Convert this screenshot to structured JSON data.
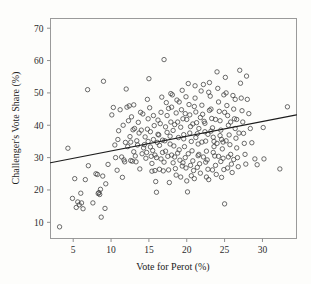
{
  "chart_data": {
    "type": "scatter",
    "title": "",
    "xlabel": "Vote for Perot (%)",
    "ylabel": "Challenger's Vote Share (%)",
    "xlim": [
      2.0,
      34.5
    ],
    "ylim": [
      5.0,
      73.0
    ],
    "xticks": [
      5,
      10,
      15,
      20,
      25,
      30
    ],
    "yticks": [
      10,
      20,
      30,
      40,
      50,
      60,
      70
    ],
    "xtick_labels": [
      "5",
      "10",
      "15",
      "20",
      "25",
      "30"
    ],
    "ytick_labels": [
      "10",
      "20",
      "30",
      "40",
      "50",
      "60",
      "70"
    ],
    "grid": false,
    "legend": null,
    "marker": {
      "style": "open-circle",
      "radius_px": 2.2,
      "edge_color": "#3c3c3c",
      "fill_color": "none"
    },
    "frame_color": "#9a9a9a",
    "background_color": "#fdfdfb",
    "trendline": {
      "type": "linear-fit",
      "color": "#1c1c1c",
      "x_start": 2.0,
      "y_start": 28.4,
      "x_end": 34.5,
      "y_end": 43.2,
      "slope": 0.455,
      "intercept": 27.49
    },
    "n_points": 281,
    "points": [
      [
        3.2,
        8.6
      ],
      [
        4.3,
        32.9
      ],
      [
        4.9,
        17.4
      ],
      [
        5.2,
        23.5
      ],
      [
        5.4,
        14.6
      ],
      [
        5.6,
        16.3
      ],
      [
        5.8,
        15.4
      ],
      [
        6.0,
        19.0
      ],
      [
        6.1,
        16.0
      ],
      [
        6.3,
        14.2
      ],
      [
        6.6,
        23.2
      ],
      [
        6.9,
        51.0
      ],
      [
        7.0,
        27.5
      ],
      [
        7.6,
        16.0
      ],
      [
        8.0,
        25.0
      ],
      [
        8.2,
        24.8
      ],
      [
        8.3,
        18.9
      ],
      [
        8.4,
        19.2
      ],
      [
        8.5,
        18.6
      ],
      [
        8.6,
        20.2
      ],
      [
        8.7,
        11.6
      ],
      [
        8.9,
        24.3
      ],
      [
        9.0,
        53.6
      ],
      [
        9.2,
        14.3
      ],
      [
        9.3,
        21.9
      ],
      [
        9.6,
        27.9
      ],
      [
        10.1,
        43.2
      ],
      [
        10.3,
        45.5
      ],
      [
        10.5,
        33.9
      ],
      [
        10.6,
        30.0
      ],
      [
        10.8,
        26.1
      ],
      [
        11.0,
        38.3
      ],
      [
        11.2,
        44.8
      ],
      [
        11.4,
        30.2
      ],
      [
        11.5,
        23.9
      ],
      [
        11.7,
        29.3
      ],
      [
        11.8,
        28.7
      ],
      [
        11.9,
        34.7
      ],
      [
        12.0,
        51.2
      ],
      [
        12.1,
        45.6
      ],
      [
        12.3,
        41.4
      ],
      [
        12.4,
        46.0
      ],
      [
        12.5,
        36.5
      ],
      [
        12.6,
        29.1
      ],
      [
        12.8,
        28.9
      ],
      [
        12.9,
        38.6
      ],
      [
        13.0,
        46.3
      ],
      [
        13.1,
        39.0
      ],
      [
        13.2,
        30.5
      ],
      [
        13.3,
        28.7
      ],
      [
        13.5,
        33.9
      ],
      [
        13.6,
        40.9
      ],
      [
        13.8,
        26.5
      ],
      [
        13.9,
        44.0
      ],
      [
        14.0,
        38.5
      ],
      [
        14.1,
        31.2
      ],
      [
        14.2,
        43.5
      ],
      [
        14.3,
        33.0
      ],
      [
        14.5,
        36.4
      ],
      [
        14.6,
        29.8
      ],
      [
        14.7,
        31.6
      ],
      [
        14.8,
        48.0
      ],
      [
        14.9,
        42.0
      ],
      [
        15.0,
        54.4
      ],
      [
        15.1,
        45.4
      ],
      [
        15.2,
        33.3
      ],
      [
        15.3,
        30.4
      ],
      [
        15.4,
        25.8
      ],
      [
        15.5,
        32.2
      ],
      [
        15.6,
        35.6
      ],
      [
        15.7,
        39.9
      ],
      [
        15.8,
        26.0
      ],
      [
        15.9,
        22.6
      ],
      [
        16.0,
        19.3
      ],
      [
        16.1,
        34.7
      ],
      [
        16.2,
        37.2
      ],
      [
        16.3,
        37.0
      ],
      [
        16.4,
        26.4
      ],
      [
        16.5,
        40.5
      ],
      [
        16.6,
        44.0
      ],
      [
        16.7,
        48.7
      ],
      [
        16.8,
        31.6
      ],
      [
        16.9,
        25.9
      ],
      [
        17.0,
        60.3
      ],
      [
        17.1,
        35.2
      ],
      [
        17.2,
        39.5
      ],
      [
        17.3,
        47.0
      ],
      [
        17.4,
        43.0
      ],
      [
        17.5,
        30.4
      ],
      [
        17.6,
        26.2
      ],
      [
        17.7,
        22.3
      ],
      [
        17.8,
        36.6
      ],
      [
        17.9,
        41.0
      ],
      [
        18.0,
        45.6
      ],
      [
        18.1,
        49.4
      ],
      [
        18.2,
        38.4
      ],
      [
        18.3,
        33.6
      ],
      [
        18.4,
        30.2
      ],
      [
        18.5,
        26.6
      ],
      [
        18.6,
        43.8
      ],
      [
        18.7,
        47.8
      ],
      [
        18.8,
        41.0
      ],
      [
        18.9,
        36.2
      ],
      [
        19.0,
        32.4
      ],
      [
        19.1,
        29.2
      ],
      [
        19.2,
        24.0
      ],
      [
        19.3,
        44.8
      ],
      [
        19.4,
        50.8
      ],
      [
        19.5,
        42.0
      ],
      [
        19.6,
        37.1
      ],
      [
        19.7,
        33.4
      ],
      [
        19.8,
        30.0
      ],
      [
        19.9,
        26.8
      ],
      [
        20.0,
        22.8
      ],
      [
        20.1,
        19.4
      ],
      [
        20.2,
        52.9
      ],
      [
        20.3,
        46.4
      ],
      [
        20.4,
        43.2
      ],
      [
        20.5,
        39.6
      ],
      [
        20.6,
        35.0
      ],
      [
        20.7,
        32.1
      ],
      [
        20.8,
        29.0
      ],
      [
        20.9,
        26.0
      ],
      [
        21.0,
        23.5
      ],
      [
        21.1,
        48.4
      ],
      [
        21.2,
        44.1
      ],
      [
        21.3,
        40.8
      ],
      [
        21.4,
        37.4
      ],
      [
        21.5,
        34.2
      ],
      [
        21.6,
        31.0
      ],
      [
        21.7,
        28.1
      ],
      [
        21.8,
        25.2
      ],
      [
        21.9,
        50.6
      ],
      [
        22.0,
        46.2
      ],
      [
        22.1,
        43.4
      ],
      [
        22.2,
        52.6
      ],
      [
        22.3,
        41.2
      ],
      [
        22.4,
        38.0
      ],
      [
        22.5,
        35.1
      ],
      [
        22.6,
        32.0
      ],
      [
        22.7,
        29.3
      ],
      [
        22.8,
        26.4
      ],
      [
        22.9,
        23.2
      ],
      [
        23.0,
        53.2
      ],
      [
        23.1,
        49.0
      ],
      [
        23.2,
        45.0
      ],
      [
        23.3,
        42.1
      ],
      [
        23.4,
        39.2
      ],
      [
        23.5,
        36.3
      ],
      [
        23.6,
        33.4
      ],
      [
        23.7,
        30.5
      ],
      [
        23.8,
        27.6
      ],
      [
        23.9,
        24.8
      ],
      [
        24.0,
        56.5
      ],
      [
        24.1,
        51.4
      ],
      [
        24.2,
        47.2
      ],
      [
        24.3,
        44.3
      ],
      [
        24.4,
        41.4
      ],
      [
        24.5,
        38.5
      ],
      [
        24.6,
        35.6
      ],
      [
        24.7,
        32.7
      ],
      [
        24.8,
        29.8
      ],
      [
        24.9,
        26.3
      ],
      [
        25.0,
        15.7
      ],
      [
        25.1,
        54.8
      ],
      [
        25.2,
        50.0
      ],
      [
        25.3,
        46.1
      ],
      [
        25.4,
        43.0
      ],
      [
        25.5,
        40.0
      ],
      [
        25.6,
        37.0
      ],
      [
        25.7,
        34.0
      ],
      [
        25.8,
        31.0
      ],
      [
        25.9,
        28.0
      ],
      [
        26.0,
        25.4
      ],
      [
        26.1,
        49.2
      ],
      [
        26.2,
        45.0
      ],
      [
        26.3,
        42.0
      ],
      [
        26.4,
        39.0
      ],
      [
        26.5,
        36.0
      ],
      [
        26.6,
        33.0
      ],
      [
        26.7,
        30.0
      ],
      [
        26.8,
        27.2
      ],
      [
        27.0,
        57.0
      ],
      [
        27.1,
        53.0
      ],
      [
        27.2,
        48.4
      ],
      [
        27.3,
        44.5
      ],
      [
        27.4,
        41.0
      ],
      [
        27.5,
        37.5
      ],
      [
        27.6,
        34.4
      ],
      [
        27.7,
        31.0
      ],
      [
        27.8,
        28.0
      ],
      [
        27.9,
        55.2
      ],
      [
        28.0,
        48.0
      ],
      [
        28.2,
        43.6
      ],
      [
        28.4,
        39.0
      ],
      [
        28.6,
        34.6
      ],
      [
        29.0,
        29.6
      ],
      [
        29.3,
        27.8
      ],
      [
        30.1,
        39.3
      ],
      [
        30.2,
        29.6
      ],
      [
        32.3,
        26.5
      ],
      [
        33.3,
        45.7
      ],
      [
        16.2,
        41.6
      ],
      [
        16.8,
        35.4
      ],
      [
        17.2,
        32.0
      ],
      [
        17.6,
        45.2
      ],
      [
        18.2,
        28.4
      ],
      [
        18.6,
        24.6
      ],
      [
        19.0,
        47.2
      ],
      [
        19.4,
        27.4
      ],
      [
        19.8,
        43.6
      ],
      [
        20.2,
        31.2
      ],
      [
        20.6,
        24.4
      ],
      [
        21.0,
        45.8
      ],
      [
        21.4,
        27.0
      ],
      [
        21.8,
        42.4
      ],
      [
        22.2,
        30.2
      ],
      [
        22.6,
        24.0
      ],
      [
        23.0,
        44.6
      ],
      [
        23.4,
        26.2
      ],
      [
        23.8,
        41.8
      ],
      [
        24.2,
        30.4
      ],
      [
        24.6,
        23.9
      ],
      [
        25.0,
        44.0
      ],
      [
        25.4,
        26.8
      ],
      [
        25.8,
        41.0
      ],
      [
        26.2,
        29.4
      ],
      [
        13.4,
        35.2
      ],
      [
        14.4,
        34.0
      ],
      [
        15.4,
        28.2
      ],
      [
        16.6,
        29.6
      ],
      [
        17.8,
        34.2
      ],
      [
        18.8,
        31.4
      ],
      [
        19.6,
        35.8
      ],
      [
        20.4,
        37.6
      ],
      [
        21.2,
        36.2
      ],
      [
        22.0,
        34.8
      ],
      [
        22.8,
        37.2
      ],
      [
        23.6,
        35.0
      ],
      [
        24.4,
        36.8
      ],
      [
        25.2,
        35.2
      ],
      [
        26.6,
        41.8
      ],
      [
        12.2,
        33.4
      ],
      [
        13.0,
        31.8
      ],
      [
        14.8,
        38.8
      ],
      [
        15.8,
        30.8
      ],
      [
        16.4,
        33.8
      ],
      [
        17.4,
        37.8
      ],
      [
        18.4,
        40.2
      ],
      [
        19.2,
        39.4
      ],
      [
        20.0,
        41.8
      ],
      [
        20.8,
        40.4
      ],
      [
        21.6,
        39.0
      ],
      [
        22.4,
        40.6
      ],
      [
        23.2,
        38.2
      ],
      [
        24.0,
        34.4
      ],
      [
        24.8,
        34.8
      ],
      [
        11.6,
        40.0
      ],
      [
        12.7,
        42.6
      ],
      [
        14.9,
        35.0
      ],
      [
        15.2,
        38.0
      ],
      [
        16.0,
        30.0
      ],
      [
        17.0,
        28.6
      ],
      [
        18.0,
        30.8
      ],
      [
        19.5,
        28.4
      ],
      [
        20.5,
        27.6
      ],
      [
        21.5,
        30.6
      ],
      [
        22.5,
        28.6
      ],
      [
        23.5,
        31.6
      ],
      [
        24.5,
        28.8
      ],
      [
        25.5,
        30.2
      ],
      [
        26.9,
        37.6
      ],
      [
        10.9,
        35.6
      ],
      [
        12.6,
        34.8
      ],
      [
        13.7,
        37.6
      ],
      [
        15.6,
        43.0
      ],
      [
        17.9,
        49.8
      ],
      [
        19.9,
        48.8
      ],
      [
        21.1,
        52.2
      ],
      [
        22.9,
        50.2
      ],
      [
        24.9,
        49.4
      ],
      [
        26.4,
        48.0
      ]
    ]
  },
  "axis": {
    "ylabel_text": "Challenger's Vote Share (%)",
    "xlabel_text": "Vote for Perot (%)"
  }
}
